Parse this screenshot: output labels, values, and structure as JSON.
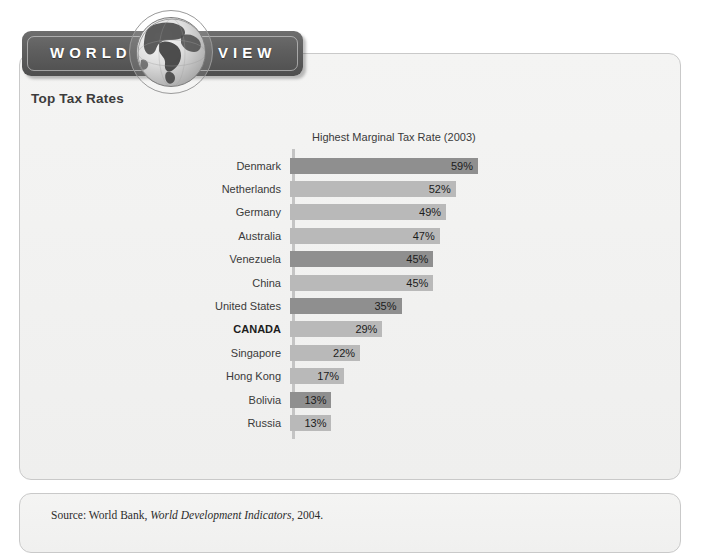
{
  "banner": {
    "word_left": "WORLD",
    "word_right": "VIEW",
    "globe_icon": "globe-icon"
  },
  "panel": {
    "title": "Top Tax Rates"
  },
  "source": {
    "prefix": "Source: World Bank, ",
    "italic": "World Development Indicators",
    "suffix": ", 2004."
  },
  "colors": {
    "bar_dark": "#8f8f8f",
    "bar_light": "#b9b9b9",
    "axis": "#c4c4c4",
    "banner": "#5e5e5e",
    "panel_bg": "#f2f2f1",
    "panel_border": "#c9c9c9"
  },
  "chart_data": {
    "type": "bar",
    "orientation": "horizontal",
    "title": "Highest Marginal Tax Rate (2003)",
    "xlabel": "",
    "ylabel": "",
    "xlim": [
      0,
      59
    ],
    "grid": false,
    "legend": "none",
    "value_suffix": "%",
    "categories": [
      "Denmark",
      "Netherlands",
      "Germany",
      "Australia",
      "Venezuela",
      "China",
      "United States",
      "CANADA",
      "Singapore",
      "Hong Kong",
      "Bolivia",
      "Russia"
    ],
    "values": [
      59,
      52,
      49,
      47,
      45,
      45,
      35,
      29,
      22,
      17,
      13,
      13
    ],
    "labels": [
      "59%",
      "52%",
      "49%",
      "47%",
      "45%",
      "45%",
      "35%",
      "29%",
      "22%",
      "17%",
      "13%",
      "13%"
    ],
    "bar_shades": [
      "dark",
      "light",
      "light",
      "light",
      "dark",
      "light",
      "dark",
      "light",
      "light",
      "light",
      "dark",
      "light"
    ],
    "highlight": "CANADA"
  }
}
